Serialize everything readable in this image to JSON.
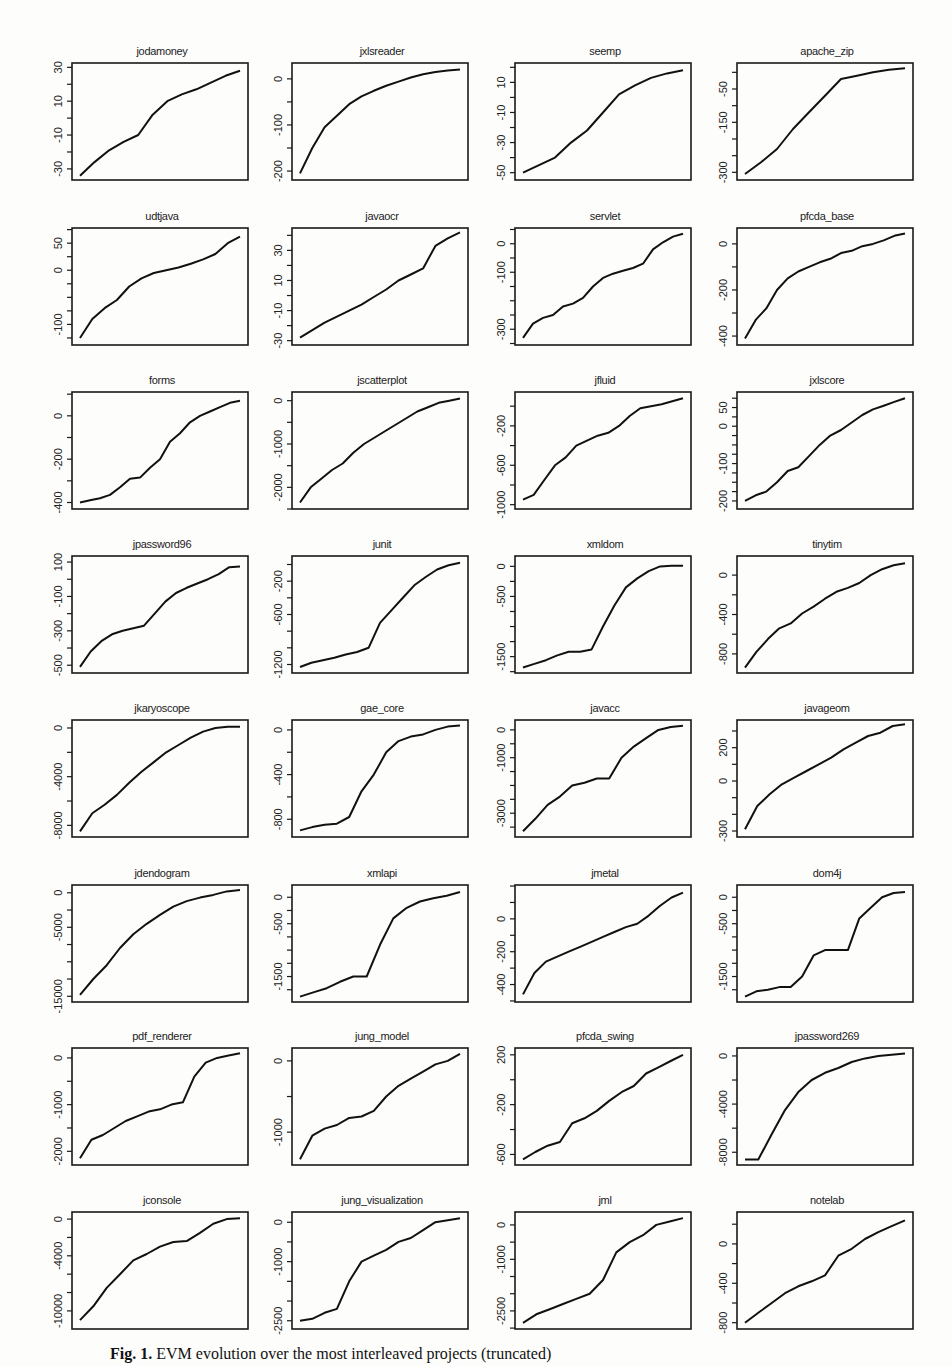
{
  "figure": {
    "caption_label": "Fig. 1.",
    "caption_text": "EVM evolution over the most interleaved projects (truncated)"
  },
  "chart_data": {
    "type": "line",
    "layout": "8x4 grid of small multiples",
    "xlabel": "",
    "ylabel": "",
    "x_ticks_shown": false,
    "grid": false,
    "panels": [
      {
        "title": "jodamoney",
        "yticks": [
          30,
          10,
          -10,
          -30
        ],
        "ylim": [
          -34,
          30
        ],
        "values": [
          -34,
          -26,
          -19,
          -14,
          -10,
          2,
          10,
          14,
          17,
          21,
          25,
          28
        ]
      },
      {
        "title": "jxlsreader",
        "yticks": [
          0,
          -100,
          -200
        ],
        "ylim": [
          -210,
          25
        ],
        "values": [
          -205,
          -150,
          -105,
          -80,
          -55,
          -38,
          -26,
          -15,
          -6,
          3,
          10,
          15,
          18,
          20
        ]
      },
      {
        "title": "seemp",
        "yticks": [
          10,
          -10,
          -30,
          -50
        ],
        "ylim": [
          -52,
          20
        ],
        "values": [
          -50,
          -45,
          -40,
          -30,
          -22,
          -10,
          2,
          8,
          13,
          16,
          18
        ]
      },
      {
        "title": "apache_zip",
        "yticks": [
          -50,
          -150,
          -300
        ],
        "ylim": [
          -310,
          15
        ],
        "values": [
          -305,
          -270,
          -230,
          -170,
          -120,
          -70,
          -20,
          -10,
          0,
          8,
          12
        ]
      },
      {
        "title": "udtjava",
        "yticks": [
          50,
          0,
          -100
        ],
        "ylim": [
          -130,
          70
        ],
        "values": [
          -125,
          -90,
          -70,
          -55,
          -30,
          -15,
          -5,
          0,
          5,
          12,
          20,
          30,
          50,
          62
        ]
      },
      {
        "title": "javaocr",
        "yticks": [
          30,
          10,
          -10,
          -30
        ],
        "ylim": [
          -30,
          42
        ],
        "values": [
          -28,
          -23,
          -18,
          -14,
          -10,
          -6,
          -1,
          4,
          10,
          14,
          18,
          33,
          38,
          42
        ]
      },
      {
        "title": "servlet",
        "yticks": [
          0,
          -100,
          -300
        ],
        "ylim": [
          -340,
          40
        ],
        "values": [
          -330,
          -280,
          -260,
          -250,
          -220,
          -210,
          -190,
          -150,
          -120,
          -105,
          -95,
          -85,
          -70,
          -20,
          5,
          25,
          35
        ]
      },
      {
        "title": "pfcda_base",
        "yticks": [
          0,
          -200,
          -400
        ],
        "ylim": [
          -420,
          50
        ],
        "values": [
          -410,
          -330,
          -280,
          -200,
          -150,
          -120,
          -100,
          -80,
          -65,
          -40,
          -30,
          -10,
          0,
          15,
          35,
          45
        ]
      },
      {
        "title": "forms",
        "yticks": [
          0,
          -200,
          -400
        ],
        "ylim": [
          -410,
          90
        ],
        "values": [
          -400,
          -390,
          -380,
          -365,
          -330,
          -290,
          -285,
          -240,
          -200,
          -120,
          -80,
          -30,
          0,
          20,
          40,
          60,
          70
        ]
      },
      {
        "title": "jscatterplot",
        "yticks": [
          0,
          -1000,
          -2000
        ],
        "ylim": [
          -2400,
          100
        ],
        "values": [
          -2350,
          -2000,
          -1800,
          -1600,
          -1450,
          -1200,
          -1000,
          -850,
          -700,
          -550,
          -400,
          -250,
          -150,
          -50,
          0,
          50
        ]
      },
      {
        "title": "jfluid",
        "yticks": [
          -200,
          -600,
          -1000
        ],
        "ylim": [
          -1000,
          100
        ],
        "values": [
          -950,
          -900,
          -750,
          -600,
          -520,
          -400,
          -350,
          -300,
          -270,
          -200,
          -100,
          -20,
          0,
          20,
          50,
          80
        ]
      },
      {
        "title": "jxlscore",
        "yticks": [
          50,
          0,
          -100,
          -200
        ],
        "ylim": [
          -210,
          80
        ],
        "values": [
          -200,
          -185,
          -175,
          -150,
          -120,
          -110,
          -80,
          -50,
          -25,
          -10,
          10,
          30,
          45,
          55,
          65,
          75
        ]
      },
      {
        "title": "jpassword96",
        "yticks": [
          100,
          -100,
          -300,
          -500
        ],
        "ylim": [
          -520,
          110
        ],
        "values": [
          -510,
          -420,
          -360,
          -320,
          -300,
          -285,
          -270,
          -200,
          -130,
          -80,
          -50,
          -25,
          0,
          30,
          70,
          75
        ]
      },
      {
        "title": "junit",
        "yticks": [
          -200,
          -600,
          -1200
        ],
        "ylim": [
          -1250,
          50
        ],
        "values": [
          -1230,
          -1180,
          -1150,
          -1120,
          -1080,
          -1050,
          -1000,
          -700,
          -550,
          -400,
          -250,
          -150,
          -60,
          -10,
          20
        ]
      },
      {
        "title": "xmldom",
        "yticks": [
          0,
          -500,
          -1500
        ],
        "ylim": [
          -1700,
          100
        ],
        "values": [
          -1680,
          -1620,
          -1560,
          -1480,
          -1420,
          -1420,
          -1380,
          -1000,
          -650,
          -350,
          -200,
          -80,
          0,
          10,
          10
        ]
      },
      {
        "title": "tinytim",
        "yticks": [
          0,
          -400,
          -800
        ],
        "ylim": [
          -950,
          150
        ],
        "values": [
          -940,
          -780,
          -650,
          -540,
          -490,
          -390,
          -320,
          -240,
          -170,
          -130,
          -80,
          0,
          60,
          100,
          120
        ]
      },
      {
        "title": "jkaryoscope",
        "yticks": [
          0,
          -4000,
          -8000
        ],
        "ylim": [
          -8600,
          300
        ],
        "values": [
          -8500,
          -7000,
          -6300,
          -5500,
          -4500,
          -3600,
          -2800,
          -2000,
          -1400,
          -800,
          -300,
          0,
          100,
          100
        ]
      },
      {
        "title": "gae_core",
        "yticks": [
          0,
          -400,
          -800
        ],
        "ylim": [
          -920,
          50
        ],
        "values": [
          -900,
          -870,
          -850,
          -840,
          -780,
          -550,
          -400,
          -200,
          -100,
          -60,
          -40,
          0,
          30,
          40
        ]
      },
      {
        "title": "javacc",
        "yticks": [
          0,
          -1000,
          -3000
        ],
        "ylim": [
          -3700,
          200
        ],
        "values": [
          -3650,
          -3200,
          -2700,
          -2400,
          -2000,
          -1900,
          -1750,
          -1750,
          -1000,
          -600,
          -300,
          0,
          100,
          150
        ]
      },
      {
        "title": "javageom",
        "yticks": [
          200,
          0,
          -300
        ],
        "ylim": [
          -310,
          340
        ],
        "values": [
          -290,
          -150,
          -80,
          -20,
          20,
          60,
          100,
          140,
          190,
          230,
          270,
          290,
          330,
          340
        ]
      },
      {
        "title": "jdendogram",
        "yticks": [
          0,
          -5000,
          -15000
        ],
        "ylim": [
          -15200,
          500
        ],
        "values": [
          -14800,
          -12500,
          -10500,
          -8000,
          -6000,
          -4500,
          -3200,
          -2000,
          -1200,
          -700,
          -300,
          200,
          400
        ]
      },
      {
        "title": "xmlapi",
        "yticks": [
          0,
          -500,
          -1500
        ],
        "ylim": [
          -1900,
          150
        ],
        "values": [
          -1880,
          -1800,
          -1720,
          -1600,
          -1500,
          -1500,
          -900,
          -400,
          -200,
          -80,
          -20,
          30,
          100
        ]
      },
      {
        "title": "jmetal",
        "yticks": [
          0,
          -200,
          -400
        ],
        "ylim": [
          -480,
          180
        ],
        "values": [
          -460,
          -330,
          -260,
          -230,
          -200,
          -170,
          -140,
          -110,
          -80,
          -50,
          -30,
          20,
          80,
          130,
          160
        ]
      },
      {
        "title": "dom4j",
        "yticks": [
          0,
          -500,
          -1500
        ],
        "ylim": [
          -1900,
          150
        ],
        "values": [
          -1880,
          -1780,
          -1750,
          -1700,
          -1700,
          -1500,
          -1100,
          -1000,
          -1000,
          -1000,
          -400,
          -200,
          0,
          80,
          100
        ]
      },
      {
        "title": "pdf_renderer",
        "yticks": [
          0,
          -1000,
          -2000
        ],
        "ylim": [
          -2200,
          120
        ],
        "values": [
          -2150,
          -1750,
          -1650,
          -1500,
          -1350,
          -1250,
          -1150,
          -1100,
          -1000,
          -950,
          -400,
          -100,
          0,
          50,
          100
        ]
      },
      {
        "title": "jung_model",
        "yticks": [
          0,
          -1000
        ],
        "ylim": [
          -1400,
          120
        ],
        "values": [
          -1380,
          -1050,
          -950,
          -900,
          -800,
          -780,
          -700,
          -500,
          -350,
          -250,
          -150,
          -50,
          0,
          100
        ]
      },
      {
        "title": "pfcda_swing",
        "yticks": [
          200,
          -200,
          -600
        ],
        "ylim": [
          -650,
          220
        ],
        "values": [
          -640,
          -580,
          -530,
          -500,
          -350,
          -310,
          -250,
          -170,
          -100,
          -50,
          50,
          100,
          150,
          200
        ]
      },
      {
        "title": "jpassword269",
        "yticks": [
          0,
          -4000,
          -8000
        ],
        "ylim": [
          -8700,
          300
        ],
        "values": [
          -8600,
          -8600,
          -6500,
          -4500,
          -3000,
          -2000,
          -1400,
          -1000,
          -500,
          -200,
          0,
          100,
          200
        ]
      },
      {
        "title": "jconsole",
        "yticks": [
          0,
          -4000,
          -10000
        ],
        "ylim": [
          -11500,
          300
        ],
        "values": [
          -11000,
          -9500,
          -7500,
          -6000,
          -4500,
          -3800,
          -3000,
          -2500,
          -2400,
          -1500,
          -500,
          0,
          100
        ]
      },
      {
        "title": "jung_visualization",
        "yticks": [
          0,
          -1000,
          -2500
        ],
        "ylim": [
          -2600,
          150
        ],
        "values": [
          -2500,
          -2450,
          -2300,
          -2200,
          -1500,
          -1000,
          -850,
          -700,
          -500,
          -400,
          -200,
          0,
          50,
          100
        ]
      },
      {
        "title": "jml",
        "yticks": [
          0,
          -1000,
          -2500
        ],
        "ylim": [
          -2900,
          250
        ],
        "values": [
          -2850,
          -2600,
          -2450,
          -2300,
          -2150,
          -2000,
          -1600,
          -800,
          -500,
          -300,
          0,
          100,
          200
        ]
      },
      {
        "title": "notelab",
        "yticks": [
          0,
          -400,
          -800
        ],
        "ylim": [
          -820,
          280
        ],
        "values": [
          -800,
          -700,
          -600,
          -500,
          -430,
          -380,
          -320,
          -120,
          -50,
          50,
          120,
          180,
          240
        ]
      }
    ]
  }
}
